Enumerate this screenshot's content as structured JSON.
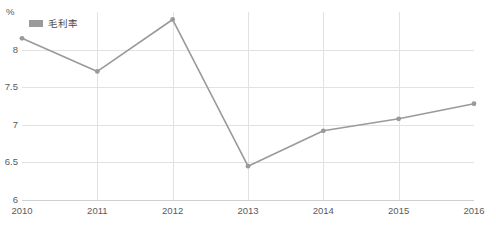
{
  "chart_data": {
    "type": "line",
    "title": "",
    "xlabel": "",
    "ylabel": "",
    "unit_label": "%",
    "categories": [
      "2010",
      "2011",
      "2012",
      "2013",
      "2014",
      "2015",
      "2016"
    ],
    "series": [
      {
        "name": "毛利率",
        "values": [
          8.15,
          7.71,
          8.4,
          6.45,
          6.92,
          7.08,
          7.28
        ],
        "color": "#9a9a9a"
      }
    ],
    "ylim": [
      6,
      8.5
    ],
    "yticks": [
      "6",
      "6.5",
      "7",
      "7.5",
      "8"
    ],
    "ytick_values": [
      6,
      6.5,
      7,
      7.5,
      8
    ],
    "grid": true,
    "legend_position": "top-left",
    "colors": {
      "line": "#9a9a9a",
      "marker": "#9a9a9a",
      "grid": "#e2e2e2",
      "axis": "#cfcfcf",
      "text": "#5a5a5a",
      "background": "#ffffff"
    }
  }
}
